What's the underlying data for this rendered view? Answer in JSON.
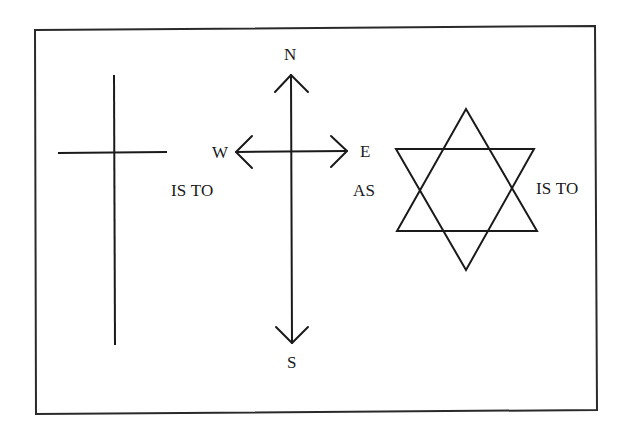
{
  "figure": {
    "type": "analogy-puzzle",
    "stroke_color": "#1a1a1a",
    "background": "#ffffff"
  },
  "cross": {
    "name": "cross-symbol"
  },
  "compass": {
    "north": "N",
    "south": "S",
    "west": "W",
    "east": "E"
  },
  "star": {
    "name": "six-pointed-star"
  },
  "connectors": {
    "first_is_to": "IS TO",
    "as": "AS",
    "second_is_to": "IS TO"
  }
}
